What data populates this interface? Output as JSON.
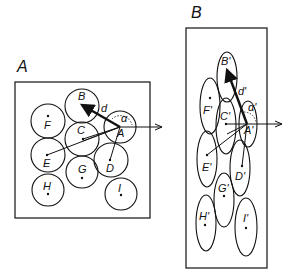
{
  "panels": {
    "a": {
      "title": "A",
      "distance_label": "d",
      "angle_label": "α",
      "cells": [
        {
          "id": "A",
          "label": "A"
        },
        {
          "id": "B",
          "label": "B"
        },
        {
          "id": "C",
          "label": "C"
        },
        {
          "id": "D",
          "label": "D"
        },
        {
          "id": "E",
          "label": "E"
        },
        {
          "id": "F",
          "label": "F"
        },
        {
          "id": "G",
          "label": "G"
        },
        {
          "id": "H",
          "label": "H"
        },
        {
          "id": "I",
          "label": "I"
        }
      ]
    },
    "b": {
      "title": "B",
      "distance_label": "d'",
      "angle_label": "α'",
      "cells": [
        {
          "id": "A",
          "label": "A'"
        },
        {
          "id": "B",
          "label": "B'"
        },
        {
          "id": "C",
          "label": "C'"
        },
        {
          "id": "D",
          "label": "D'"
        },
        {
          "id": "E",
          "label": "E'"
        },
        {
          "id": "F",
          "label": "F'"
        },
        {
          "id": "G",
          "label": "G'"
        },
        {
          "id": "H",
          "label": "H'"
        },
        {
          "id": "I",
          "label": "I'"
        }
      ]
    }
  },
  "colors": {
    "stroke": "#111111",
    "background": "#ffffff"
  }
}
